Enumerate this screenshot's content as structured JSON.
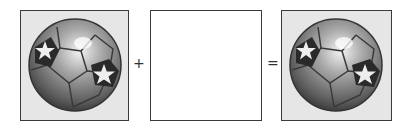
{
  "equation": {
    "operand_a": {
      "type": "image",
      "icon": "soccer-ball-with-stars"
    },
    "operator_plus": "+",
    "operand_b": {
      "type": "blank"
    },
    "operator_equals": "=",
    "result": {
      "type": "image",
      "icon": "soccer-ball-with-stars"
    }
  },
  "colors": {
    "box_border": "#3a3a3a",
    "image_background": "#e6e6e6",
    "ball_dark": "#3c3c3c",
    "ball_mid": "#8a8a8a",
    "ball_light": "#d8d8d8"
  }
}
